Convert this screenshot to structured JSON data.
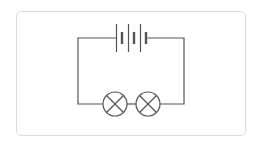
{
  "diagram": {
    "type": "circuit-schematic",
    "colors": {
      "wire": "#555555",
      "card_border": "#dcdcdc",
      "background": "#ffffff"
    },
    "components": [
      {
        "kind": "battery",
        "cells": 3,
        "position": "top"
      },
      {
        "kind": "lamp",
        "index": 1,
        "position": "bottom-left"
      },
      {
        "kind": "lamp",
        "index": 2,
        "position": "bottom-right"
      }
    ]
  }
}
